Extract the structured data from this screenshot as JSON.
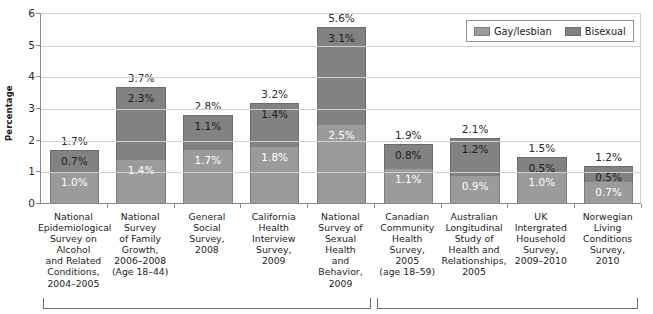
{
  "chart_data": {
    "type": "bar",
    "subtype": "stacked-vertical",
    "title": "",
    "xlabel": "",
    "ylabel": "Percentage",
    "ylim": [
      0,
      6
    ],
    "ytick_labels": [
      "0",
      "1",
      "2",
      "3",
      "4",
      "5",
      "6"
    ],
    "yticks": [
      0,
      1,
      2,
      3,
      4,
      5,
      6
    ],
    "grid": true,
    "grid_axis": "y",
    "legend_position": "top-right",
    "value_suffix": "%",
    "categories": [
      "National Epidemiological Survey on Alcohol and Related Conditions, 2004–2005",
      "National Survey of Family Growth, 2006–2008 (Age 18–44)",
      "General Social Survey, 2008",
      "California Health Interview Survey, 2009",
      "National Survey of Sexual Health and Behavior, 2009",
      "Canadian Community Health Survey, 2005 (age 18–59)",
      "Australian Longitudinal Study of Health and Relationships, 2005",
      "UK Intergrated Household Survey, 2009–2010",
      "Norwegian Living Conditions Survey, 2010"
    ],
    "category_lines": [
      [
        "National",
        "Epidemiological",
        "Survey on",
        "Alcohol",
        "and Related",
        "Conditions,",
        "2004–2005"
      ],
      [
        "National",
        "Survey",
        "of Family",
        "Growth,",
        "2006–2008",
        "(Age 18–44)"
      ],
      [
        "General",
        "Social",
        "Survey,",
        "2008"
      ],
      [
        "California",
        "Health",
        "Interview",
        "Survey,",
        "2009"
      ],
      [
        "National",
        "Survey of",
        "Sexual",
        "Health",
        "and",
        "Behavior,",
        "2009"
      ],
      [
        "Canadian",
        "Community",
        "Health",
        "Survey,",
        "2005",
        "(age 18–59)"
      ],
      [
        "Australian",
        "Longitudinal",
        "Study of",
        "Health and",
        "Relationships,",
        "2005"
      ],
      [
        "UK",
        "Intergrated",
        "Household",
        "Survey,",
        "2009–2010"
      ],
      [
        "Norwegian",
        "Living",
        "Conditions",
        "Survey,",
        "2010"
      ]
    ],
    "series": [
      {
        "name": "Gay/lesbian",
        "color": "#9b9b9b",
        "values": [
          1.0,
          1.4,
          1.7,
          1.8,
          2.5,
          1.1,
          0.9,
          1.0,
          0.7
        ],
        "labels": [
          "1.0%",
          "1.4%",
          "1.7%",
          "1.8%",
          "2.5%",
          "1.1%",
          "0.9%",
          "1.0%",
          "0.7%"
        ]
      },
      {
        "name": "Bisexual",
        "color": "#828282",
        "values": [
          0.7,
          2.3,
          1.1,
          1.4,
          3.1,
          0.8,
          1.2,
          0.5,
          0.5
        ],
        "labels": [
          "0.7%",
          "2.3%",
          "1.1%",
          "1.4%",
          "3.1%",
          "0.8%",
          "1.2%",
          "0.5%",
          "0.5%"
        ]
      }
    ],
    "totals": [
      1.7,
      3.7,
      2.8,
      3.2,
      5.6,
      1.9,
      2.1,
      1.5,
      1.2
    ],
    "total_labels": [
      "1.7%",
      "3.7%",
      "2.8%",
      "3.2%",
      "5.6%",
      "1.9%",
      "2.1%",
      "1.5%",
      "1.2%"
    ],
    "groups": [
      {
        "name": "United States surveys",
        "first_index": 0,
        "last_index": 4
      },
      {
        "name": "International surveys",
        "first_index": 5,
        "last_index": 8
      }
    ]
  },
  "legend": {
    "items": [
      {
        "label": "Gay/lesbian",
        "swatch": "legend-swatch-gay-lesbian"
      },
      {
        "label": "Bisexual",
        "swatch": "legend-swatch-bisexual"
      }
    ]
  },
  "colors": {
    "gay_lesbian": "#9b9b9b",
    "bisexual": "#828282",
    "gridline": "#d0d0d0",
    "axis": "#8a8a8a",
    "text": "#232323"
  }
}
